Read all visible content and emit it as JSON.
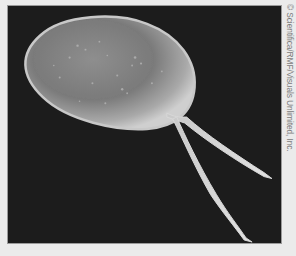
{
  "figure": {
    "credit": "© Scientifica/RMF/Visuals Unlimited, Inc.",
    "colors": {
      "page_background": "#ebebeb",
      "photo_background": "#1c1c1c",
      "cell_body": "#b8b8b8",
      "credit_text": "#7a7a7a"
    }
  }
}
